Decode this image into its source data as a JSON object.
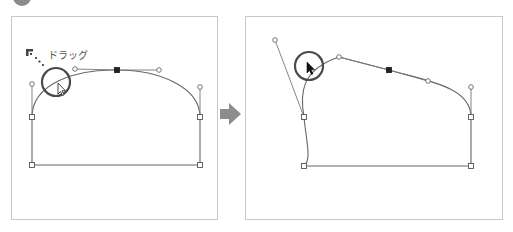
{
  "figure": {
    "step_badge": {
      "color": "#8a8a8a"
    },
    "arrow": {
      "color": "#8c8c8c",
      "direction": "right"
    },
    "panels": [
      {
        "name": "before",
        "drag_label": "ドラッグ",
        "drag_start_icon": "corner-bracket-icon",
        "cursor": "hollow-arrow-pointer",
        "anchors": [
          [
            32,
            117
          ],
          [
            117,
            70
          ],
          [
            200,
            117
          ],
          [
            32,
            165
          ],
          [
            200,
            165
          ]
        ],
        "handles": [
          [
            32,
            84
          ],
          [
            75,
            69
          ],
          [
            159,
            70
          ],
          [
            200,
            87
          ]
        ]
      },
      {
        "name": "after",
        "cursor": "filled-arrow-pointer",
        "anchors": [
          [
            304,
            117
          ],
          [
            389,
            70
          ],
          [
            471,
            117
          ],
          [
            304,
            166
          ],
          [
            471,
            166
          ]
        ],
        "handles": [
          [
            275,
            40
          ],
          [
            339,
            57
          ],
          [
            428,
            81
          ],
          [
            471,
            87
          ]
        ]
      }
    ],
    "colors": {
      "panel_border": "#c8c8c8",
      "path_stroke": "#666666",
      "handle_line": "#777777",
      "anchor_selected": "#222222",
      "circle_stroke": "#4a4a4a"
    }
  }
}
